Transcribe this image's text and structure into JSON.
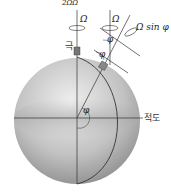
{
  "diagram": {
    "title_partial": "2ΩΩ",
    "labels": {
      "pole_axis_omega": "Ω",
      "local_axis_omega": "Ω",
      "vertical_component": "Ω sin φ",
      "angle_top": "φ",
      "angle_tangent": "φ",
      "angle_center": "φ",
      "pole": "극",
      "equator": "적도"
    },
    "colors": {
      "sphere_light": "#e8e8e8",
      "sphere_dark": "#9a9a9a",
      "line": "#333333",
      "band": "#c4c4c4"
    }
  }
}
